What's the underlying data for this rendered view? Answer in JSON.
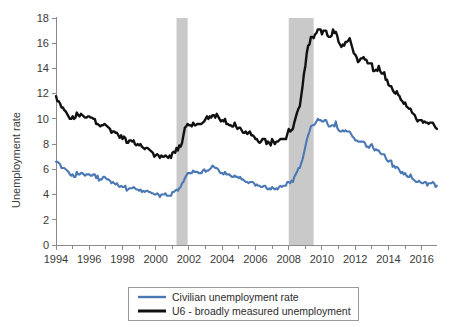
{
  "chart_data": {
    "type": "line",
    "title": "",
    "xlabel": "",
    "ylabel": "Unemployment rate",
    "ylim": [
      0,
      18
    ],
    "xlim": [
      1994.0,
      2016.92
    ],
    "ytick_labels": [
      "0",
      "2",
      "4",
      "6",
      "8",
      "10",
      "12",
      "14",
      "16",
      "18"
    ],
    "ytick_values": [
      0,
      2,
      4,
      6,
      8,
      10,
      12,
      14,
      16,
      18
    ],
    "xtick_labels": [
      "1994",
      "1996",
      "1998",
      "2000",
      "2002",
      "2004",
      "2006",
      "2008",
      "2010",
      "2012",
      "2014",
      "2016"
    ],
    "xtick_values": [
      1994,
      1996,
      1998,
      2000,
      2002,
      2004,
      2006,
      2008,
      2010,
      2012,
      2014,
      2016
    ],
    "xtick_minor_values": [
      1995,
      1997,
      1999,
      2001,
      2003,
      2005,
      2007,
      2009,
      2011,
      2013,
      2015
    ],
    "grid": false,
    "legend_position": "bottom-center",
    "annotations": [
      {
        "type": "shaded-band",
        "name": "recession-2001",
        "x_start": 2001.25,
        "x_end": 2001.92,
        "color": "#c9c9c9"
      },
      {
        "type": "shaded-band",
        "name": "recession-2008",
        "x_start": 2008.0,
        "x_end": 2009.5,
        "color": "#c9c9c9"
      }
    ],
    "x_start_year": 1994,
    "x_step_months": 1,
    "series": [
      {
        "name": "Civilian unemployment rate",
        "color": "#4a78b4",
        "line_width": 2.1,
        "values": [
          6.6,
          6.6,
          6.5,
          6.4,
          6.1,
          6.1,
          6.1,
          6.0,
          5.9,
          5.8,
          5.6,
          5.5,
          5.6,
          5.4,
          5.4,
          5.8,
          5.6,
          5.6,
          5.7,
          5.7,
          5.6,
          5.5,
          5.6,
          5.6,
          5.6,
          5.5,
          5.5,
          5.6,
          5.6,
          5.3,
          5.5,
          5.1,
          5.2,
          5.2,
          5.4,
          5.4,
          5.3,
          5.2,
          5.2,
          5.1,
          4.9,
          5.0,
          4.9,
          4.8,
          4.9,
          4.7,
          4.6,
          4.7,
          4.6,
          4.6,
          4.7,
          4.3,
          4.4,
          4.5,
          4.5,
          4.5,
          4.6,
          4.5,
          4.4,
          4.4,
          4.3,
          4.4,
          4.2,
          4.3,
          4.2,
          4.3,
          4.3,
          4.2,
          4.2,
          4.1,
          4.1,
          4.0,
          4.0,
          4.1,
          4.0,
          3.8,
          4.0,
          4.0,
          4.0,
          4.1,
          3.9,
          3.9,
          3.9,
          3.9,
          4.2,
          4.2,
          4.3,
          4.4,
          4.3,
          4.5,
          4.6,
          4.9,
          5.0,
          5.3,
          5.5,
          5.7,
          5.7,
          5.7,
          5.7,
          5.9,
          5.8,
          5.8,
          5.8,
          5.7,
          5.7,
          5.7,
          5.9,
          6.0,
          5.8,
          5.9,
          5.9,
          6.0,
          6.1,
          6.3,
          6.2,
          6.1,
          6.1,
          6.0,
          5.8,
          5.7,
          5.7,
          5.6,
          5.8,
          5.6,
          5.6,
          5.6,
          5.5,
          5.4,
          5.4,
          5.5,
          5.4,
          5.4,
          5.3,
          5.4,
          5.2,
          5.2,
          5.1,
          5.0,
          5.0,
          4.9,
          5.0,
          5.0,
          5.0,
          4.9,
          4.7,
          4.8,
          4.7,
          4.7,
          4.6,
          4.6,
          4.7,
          4.7,
          4.5,
          4.4,
          4.5,
          4.4,
          4.6,
          4.5,
          4.4,
          4.5,
          4.4,
          4.6,
          4.7,
          4.6,
          4.7,
          4.7,
          4.7,
          5.0,
          5.0,
          4.9,
          5.1,
          5.0,
          5.4,
          5.6,
          5.8,
          6.1,
          6.1,
          6.5,
          6.8,
          7.3,
          7.8,
          8.3,
          8.7,
          9.0,
          9.4,
          9.5,
          9.5,
          9.6,
          9.8,
          10.0,
          9.9,
          9.9,
          9.8,
          9.8,
          9.9,
          9.9,
          9.6,
          9.4,
          9.4,
          9.5,
          9.5,
          9.4,
          9.8,
          9.3,
          9.1,
          9.0,
          9.0,
          9.1,
          9.0,
          9.1,
          9.0,
          9.0,
          9.0,
          8.8,
          8.6,
          8.5,
          8.3,
          8.3,
          8.2,
          8.2,
          8.2,
          8.2,
          8.2,
          8.1,
          7.8,
          7.8,
          7.7,
          7.9,
          8.0,
          7.7,
          7.5,
          7.6,
          7.5,
          7.5,
          7.3,
          7.2,
          7.2,
          7.2,
          6.9,
          6.7,
          6.6,
          6.7,
          6.7,
          6.2,
          6.3,
          6.1,
          6.2,
          6.1,
          5.9,
          5.7,
          5.8,
          5.6,
          5.7,
          5.5,
          5.4,
          5.4,
          5.6,
          5.3,
          5.2,
          5.1,
          5.0,
          5.0,
          5.1,
          5.0,
          4.9,
          4.9,
          5.0,
          5.0,
          4.7,
          4.9,
          4.9,
          4.9,
          5.0,
          4.9,
          4.6,
          4.7
        ]
      },
      {
        "name": "U6 - broadly measured unemployment",
        "color": "#111111",
        "line_width": 2.4,
        "values": [
          11.8,
          11.4,
          11.4,
          11.2,
          10.9,
          10.9,
          10.7,
          10.6,
          10.4,
          10.2,
          10.0,
          10.0,
          10.2,
          10.0,
          10.1,
          10.5,
          10.3,
          10.2,
          10.4,
          10.3,
          10.2,
          10.1,
          10.1,
          10.2,
          10.2,
          10.1,
          10.1,
          10.0,
          10.0,
          9.6,
          9.6,
          9.5,
          9.4,
          9.5,
          9.5,
          9.6,
          9.5,
          9.4,
          9.3,
          9.2,
          8.9,
          9.0,
          9.0,
          8.9,
          8.9,
          8.7,
          8.5,
          8.7,
          8.4,
          8.6,
          8.5,
          8.1,
          8.1,
          8.3,
          8.3,
          8.2,
          8.3,
          8.0,
          7.9,
          8.0,
          7.9,
          8.0,
          7.8,
          7.7,
          7.6,
          7.7,
          7.7,
          7.6,
          7.5,
          7.4,
          7.3,
          7.0,
          7.1,
          7.2,
          7.1,
          6.9,
          7.1,
          7.0,
          7.0,
          7.1,
          7.0,
          6.9,
          7.1,
          6.9,
          7.3,
          7.4,
          7.3,
          7.7,
          7.5,
          7.9,
          7.8,
          8.1,
          8.7,
          9.3,
          9.4,
          9.6,
          9.5,
          9.5,
          9.4,
          9.7,
          9.5,
          9.5,
          9.6,
          9.6,
          9.6,
          9.6,
          9.7,
          9.8,
          10.0,
          10.2,
          10.0,
          10.2,
          10.1,
          10.3,
          10.3,
          10.1,
          10.4,
          10.2,
          10.0,
          9.8,
          9.9,
          9.8,
          10.0,
          9.6,
          9.6,
          9.5,
          9.5,
          9.4,
          9.4,
          9.7,
          9.4,
          9.2,
          9.3,
          9.3,
          9.1,
          8.9,
          8.9,
          9.0,
          8.8,
          8.9,
          9.0,
          8.7,
          8.7,
          8.6,
          8.4,
          8.4,
          8.2,
          8.1,
          8.2,
          8.4,
          8.4,
          8.4,
          8.0,
          8.2,
          8.1,
          7.9,
          8.4,
          8.2,
          8.0,
          8.2,
          8.2,
          8.3,
          8.4,
          8.4,
          8.4,
          8.4,
          8.4,
          8.8,
          9.2,
          9.0,
          9.1,
          9.2,
          9.7,
          10.1,
          10.5,
          10.8,
          11.0,
          11.8,
          12.6,
          13.6,
          14.2,
          15.2,
          15.8,
          15.9,
          16.5,
          16.5,
          16.4,
          16.7,
          16.8,
          17.1,
          17.1,
          17.1,
          16.7,
          17.0,
          17.0,
          17.0,
          16.6,
          16.5,
          16.5,
          16.6,
          17.1,
          16.8,
          16.9,
          16.6,
          16.1,
          15.9,
          15.7,
          15.9,
          15.8,
          16.1,
          16.1,
          16.2,
          16.4,
          16.0,
          15.6,
          15.2,
          15.1,
          14.9,
          14.5,
          14.6,
          14.8,
          14.8,
          14.9,
          14.7,
          14.7,
          14.4,
          14.4,
          14.4,
          14.4,
          13.8,
          13.8,
          13.9,
          13.8,
          14.2,
          13.8,
          13.6,
          13.6,
          13.7,
          13.1,
          13.1,
          12.7,
          12.6,
          12.6,
          12.3,
          12.1,
          12.0,
          12.2,
          11.9,
          11.8,
          11.5,
          11.4,
          11.2,
          11.3,
          11.0,
          10.9,
          10.8,
          10.8,
          10.5,
          10.4,
          10.3,
          10.0,
          9.8,
          9.9,
          9.9,
          9.9,
          9.7,
          9.8,
          9.7,
          9.7,
          9.6,
          9.7,
          9.7,
          9.7,
          9.5,
          9.3,
          9.2
        ]
      }
    ]
  },
  "legend": {
    "items": [
      {
        "label": "Civilian unemployment rate",
        "color": "#4a78b4"
      },
      {
        "label": "U6 - broadly measured unemployment",
        "color": "#111111"
      }
    ]
  },
  "axes": {
    "y_title": "Unemployment rate"
  }
}
